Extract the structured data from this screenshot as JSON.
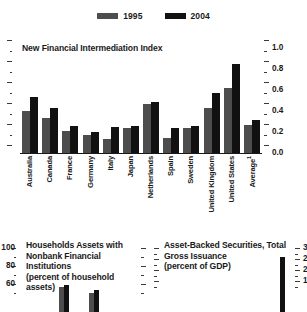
{
  "legend": {
    "items": [
      {
        "label": "1995",
        "color": "#4d4d4d",
        "swatch_name": "legend-swatch-1995"
      },
      {
        "label": "2004",
        "color": "#111111",
        "swatch_name": "legend-swatch-2004"
      }
    ]
  },
  "chart_data": [
    {
      "id": "new-financial-intermediation-index",
      "type": "bar",
      "title": "New Financial Intermediation Index",
      "xlabel": "",
      "ylabel": "",
      "ylim": [
        0.0,
        1.0
      ],
      "y_axis_position": "right",
      "grid": false,
      "legend_position": "top-center",
      "tick_labels": [
        "0.0",
        "0.2",
        "0.4",
        "0.6",
        "0.8",
        "1.0"
      ],
      "tick_values": [
        0.0,
        0.2,
        0.4,
        0.6,
        0.8,
        1.0
      ],
      "categories": [
        "Australia",
        "Canada",
        "France",
        "Germany",
        "Italy",
        "Japan",
        "Netherlands",
        "Spain",
        "Sweden",
        "United Kingdom",
        "United States",
        "Average"
      ],
      "category_footnotes": {
        "Average": "1"
      },
      "series": [
        {
          "name": "1995",
          "color": "#4d4d4d",
          "values": [
            0.4,
            0.33,
            0.21,
            0.17,
            0.13,
            0.24,
            0.47,
            0.14,
            0.24,
            0.43,
            0.62,
            0.27
          ]
        },
        {
          "name": "2004",
          "color": "#111111",
          "values": [
            0.53,
            0.43,
            0.26,
            0.2,
            0.25,
            0.26,
            0.49,
            0.24,
            0.26,
            0.57,
            0.85,
            0.31
          ]
        }
      ]
    },
    {
      "id": "household-assets-nonbank",
      "type": "bar",
      "title": "Households Assets with Nonbank Financial Institutions (percent of household assets)",
      "title_lines": [
        "Households Assets with",
        "Nonbank Financial",
        "Institutions",
        "(percent of household",
        "assets)"
      ],
      "ylabel": "",
      "ylim": [
        0,
        100
      ],
      "y_axis_position": "left",
      "tick_labels": [
        "60",
        "80",
        "100"
      ],
      "tick_values": [
        60,
        80,
        100
      ],
      "grid": false,
      "categories": [
        "A",
        "B",
        "C",
        "D"
      ],
      "series": [
        {
          "name": "1995",
          "color": "#4d4d4d",
          "values": [
            null,
            57,
            50,
            null
          ]
        },
        {
          "name": "2004",
          "color": "#111111",
          "values": [
            null,
            59,
            53,
            null
          ]
        }
      ]
    },
    {
      "id": "asset-backed-securities-gross-issuance",
      "type": "bar",
      "title": "Asset-Backed Securities, Total Gross Issuance (percent of GDP)",
      "title_lines": [
        "Asset-Backed Securities, Total",
        "Gross Issuance",
        "(percent of GDP)"
      ],
      "ylabel": "",
      "ylim": [
        0,
        30
      ],
      "y_axis_position": "right",
      "tick_labels": [
        "15",
        "20",
        "25",
        "30"
      ],
      "tick_values": [
        15,
        20,
        25,
        30
      ],
      "grid": false,
      "categories": [
        "A"
      ],
      "series": [
        {
          "name": "2004",
          "color": "#111111",
          "values": [
            26
          ]
        }
      ]
    }
  ]
}
